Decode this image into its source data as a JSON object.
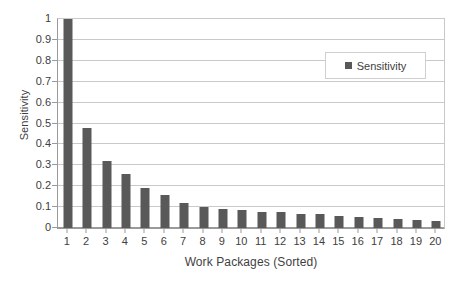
{
  "chart_data": {
    "type": "bar",
    "title": "",
    "xlabel": "Work Packages (Sorted)",
    "ylabel": "Sensitivity",
    "categories": [
      "1",
      "2",
      "3",
      "4",
      "5",
      "6",
      "7",
      "8",
      "9",
      "10",
      "11",
      "12",
      "13",
      "14",
      "15",
      "16",
      "17",
      "18",
      "19",
      "20"
    ],
    "values": [
      1.0,
      0.48,
      0.32,
      0.26,
      0.19,
      0.16,
      0.12,
      0.1,
      0.09,
      0.085,
      0.078,
      0.075,
      0.068,
      0.065,
      0.058,
      0.053,
      0.047,
      0.042,
      0.04,
      0.033
    ],
    "series": [
      {
        "name": "Sensitivity",
        "color": "#595959",
        "values": [
          1.0,
          0.48,
          0.32,
          0.26,
          0.19,
          0.16,
          0.12,
          0.1,
          0.09,
          0.085,
          0.078,
          0.075,
          0.068,
          0.065,
          0.058,
          0.053,
          0.047,
          0.042,
          0.04,
          0.033
        ]
      }
    ],
    "ylim": [
      0,
      1
    ],
    "yticks": [
      0,
      0.1,
      0.2,
      0.3,
      0.4,
      0.5,
      0.6,
      0.7,
      0.8,
      0.9,
      1
    ],
    "ytick_labels": [
      "0",
      "0.1",
      "0.2",
      "0.3",
      "0.4",
      "0.5",
      "0.6",
      "0.7",
      "0.8",
      "0.9",
      "1"
    ],
    "grid": true,
    "grid_axis": "y",
    "legend": {
      "entries": [
        "Sensitivity"
      ],
      "position": "upper-right-inside",
      "marker": "square"
    },
    "colors": {
      "bar": "#595959",
      "gridline": "#c9c9c9",
      "axis": "#9a9a9a",
      "text": "#404040",
      "background": "#ffffff"
    }
  }
}
